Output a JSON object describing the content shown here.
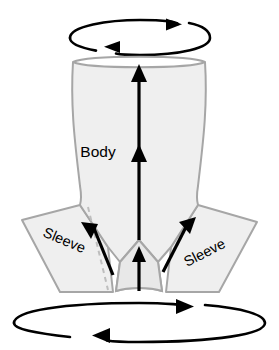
{
  "diagram": {
    "title": "Garment body and sleeve draw direction diagram",
    "labels": {
      "body": "Body",
      "sleeve_left": "Sleeve",
      "sleeve_right": "Sleeve"
    },
    "colors": {
      "garment_fill": "#EFEFEF",
      "garment_stroke": "#A6A6A6",
      "seam_dashed": "#BEBEBE",
      "arrow": "#000000",
      "background": "#FFFFFF"
    },
    "icons": {
      "rotation_top": "rotation-ellipse-icon",
      "rotation_bottom": "rotation-ellipse-icon",
      "body_flow": "up-arrow-icon",
      "sleeve_left_flow": "up-left-diagonal-arrow-icon",
      "sleeve_right_flow": "up-right-diagonal-arrow-icon",
      "hem_flow": "up-arrow-icon"
    },
    "annotations": {
      "top_rotation": "bidirectional rotation",
      "bottom_rotation": "bidirectional rotation",
      "body_direction": "upward",
      "sleeve_direction": "upward and inward"
    }
  }
}
